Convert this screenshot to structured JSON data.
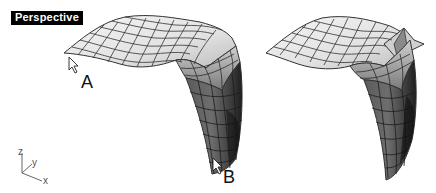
{
  "viewport": {
    "title": "Perspective",
    "background": "#ffffff"
  },
  "surfaces": [
    {
      "name": "original-surface",
      "description": "Arched NURBS surface with grid isocurves"
    },
    {
      "name": "edited-surface",
      "description": "Arched surface with a fold/crease near the top-right corner"
    }
  ],
  "points": {
    "a": {
      "label": "A"
    },
    "b": {
      "label": "B"
    }
  },
  "axes": {
    "z": "z",
    "y": "y",
    "x": "x"
  },
  "colors": {
    "grid_line": "#333333",
    "light_face": "#efefef",
    "dark_face": "#3a3a3a",
    "label_bg": "#000000"
  }
}
